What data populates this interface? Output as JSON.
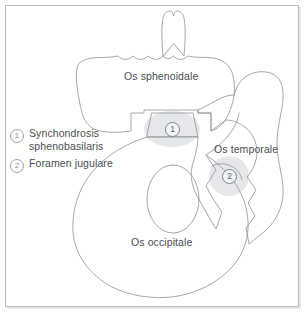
{
  "figure": {
    "background_color": "#ffffff",
    "frame_color": "#b9bcc0",
    "outline_color": "#9a9ea3",
    "text_color": "#4a4e53",
    "highlight_color": "#d9dcdf"
  },
  "bone_labels": [
    {
      "id": "sphenoidale",
      "text": "Os sphenoidale"
    },
    {
      "id": "temporale",
      "text": "Os temporale"
    },
    {
      "id": "occipitale",
      "text": "Os occipitale"
    }
  ],
  "markers": [
    {
      "id": "1",
      "number": "1"
    },
    {
      "id": "2",
      "number": "2"
    }
  ],
  "legend": {
    "items": [
      {
        "number": "1",
        "line1": "Synchondrosis",
        "line2": "sphenobasilaris"
      },
      {
        "number": "2",
        "line1": "Foramen jugulare",
        "line2": ""
      }
    ]
  }
}
